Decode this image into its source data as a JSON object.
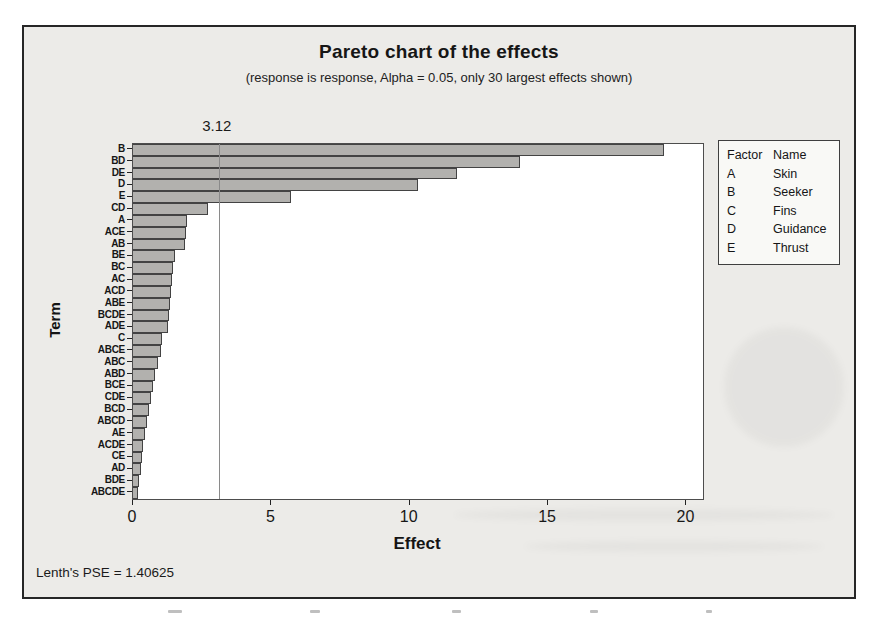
{
  "chart_data": {
    "type": "bar",
    "orientation": "horizontal",
    "title": "Pareto chart of the effects",
    "subtitle": "(response is response, Alpha = 0.05, only 30 largest effects shown)",
    "xlabel": "Effect",
    "ylabel": "Term",
    "footnote": "Lenth's PSE = 1.40625",
    "categories": [
      "B",
      "BD",
      "DE",
      "D",
      "E",
      "CD",
      "A",
      "ACE",
      "AB",
      "BE",
      "BC",
      "AC",
      "ACD",
      "ABE",
      "BCDE",
      "ADE",
      "C",
      "ABCE",
      "ABC",
      "ABD",
      "BCE",
      "CDE",
      "BCD",
      "ABCD",
      "AE",
      "ACDE",
      "CE",
      "AD",
      "BDE",
      "ABCDE"
    ],
    "values": [
      19.2,
      14.0,
      11.7,
      10.3,
      5.7,
      2.7,
      1.95,
      1.92,
      1.88,
      1.5,
      1.45,
      1.4,
      1.37,
      1.33,
      1.3,
      1.25,
      1.05,
      1.02,
      0.9,
      0.8,
      0.72,
      0.65,
      0.58,
      0.51,
      0.45,
      0.36,
      0.33,
      0.29,
      0.23,
      0.17
    ],
    "xticks": [
      0,
      5,
      10,
      15,
      20
    ],
    "xlim": [
      0,
      20.6
    ],
    "grid": false,
    "reference_value": 3.12,
    "reference_label": "3.12",
    "legend": {
      "position": "right",
      "headers": [
        "Factor",
        "Name"
      ],
      "rows": [
        [
          "A",
          "Skin"
        ],
        [
          "B",
          "Seeker"
        ],
        [
          "C",
          "Fins"
        ],
        [
          "D",
          "Guidance"
        ],
        [
          "E",
          "Thrust"
        ]
      ]
    },
    "bar_color": "#b2b1ae",
    "bar_border_color": "#434343",
    "frame_background": "#ecebe8"
  }
}
